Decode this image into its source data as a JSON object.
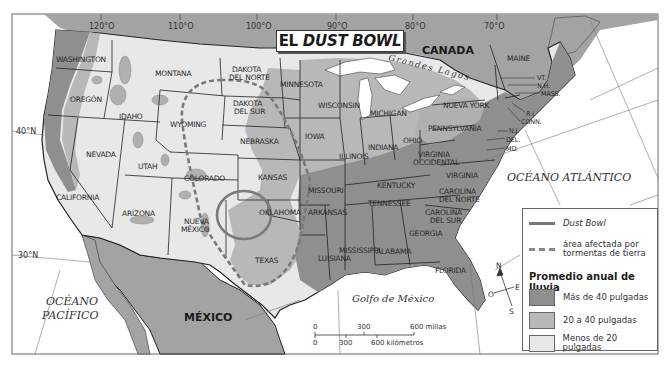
{
  "title": {
    "prefix": "EL",
    "italic": "DUST BOWL"
  },
  "graticule": {
    "longitudes": [
      "120°O",
      "110°O",
      "100°O",
      "90°O",
      "80°O",
      "70°O"
    ],
    "latitudes": [
      "40°N",
      "30°N"
    ]
  },
  "countries": [
    "CANADA",
    "MÉXICO"
  ],
  "water_labels": {
    "atlantic": "OCÉANO ATLÁNTICO",
    "pacific_line1": "OCÉANO",
    "pacific_line2": "PACÍFICO",
    "gulf": "Golfo de México",
    "great_lakes": "Grandes Lagos"
  },
  "states": {
    "washington": "WASHINGTON",
    "oregon": "OREGÓN",
    "california": "CALIFORNIA",
    "idaho": "IDAHO",
    "nevada": "NEVADA",
    "montana": "MONTANA",
    "wyoming": "WYOMING",
    "utah": "UTAH",
    "arizona": "ARIZONA",
    "colorado": "COLORADO",
    "nuevo_mexico_1": "NUEVA",
    "nuevo_mexico_2": "MÉXICO",
    "dakota_norte_1": "DAKOTA",
    "dakota_norte_2": "DEL NORTE",
    "dakota_sur_1": "DAKOTA",
    "dakota_sur_2": "DEL SUR",
    "nebraska": "NEBRASKA",
    "kansas": "KANSAS",
    "oklahoma": "OKLAHOMA",
    "texas": "TEXAS",
    "minnesota": "MINNESOTA",
    "iowa": "IOWA",
    "missouri": "MISSOURI",
    "arkansas": "ARKANSAS",
    "luisiana": "LUISIANA",
    "wisconsin": "WISCONSIN",
    "illinois": "ILLINOIS",
    "mississippi": "MISSISSIPPI",
    "michigan": "MICHIGAN",
    "indiana": "INDIANA",
    "kentucky": "KENTUCKY",
    "tennessee": "TENNESSEE",
    "alabama": "ALABAMA",
    "ohio": "OHIO",
    "georgia": "GEORGIA",
    "florida": "FLORIDA",
    "virginia_occ_1": "VIRGINIA",
    "virginia_occ_2": "OCCIDENTAL",
    "virginia": "VIRGINIA",
    "carolina_norte_1": "CAROLINA",
    "carolina_norte_2": "DEL NORTE",
    "carolina_sur_1": "CAROLINA",
    "carolina_sur_2": "DEL SUR",
    "pennsylvania": "PENNSYLVANIA",
    "nueva_york": "NUEVA YORK",
    "maine": "MAINE",
    "vt": "VT.",
    "nh": "N.H.",
    "mass": "MASS.",
    "ri": "R.I.",
    "conn": "CONN.",
    "nj": "N.J.",
    "del": "DEL.",
    "md": "MD."
  },
  "compass": {
    "n": "N",
    "s": "S",
    "e": "E",
    "o": "O"
  },
  "scale": {
    "miles_0": "0",
    "miles_300": "300",
    "miles_600": "600 millas",
    "km_0": "0",
    "km_300": "300",
    "km_600": "600 kilómetros"
  },
  "legend": {
    "dust_bowl": "Dust Bowl",
    "storm_area_1": "área afectada por",
    "storm_area_2": "tormentas de tierra",
    "rain_heading": "Promedio anual de lluvia",
    "rain_high": "Más de 40 pulgadas",
    "rain_mid": "20 a 40 pulgadas",
    "rain_low": "Menos de 20 pulgadas"
  },
  "colors": {
    "rain_high": "#8f8f8f",
    "rain_mid": "#b8b8b8",
    "rain_low": "#e8e8e8",
    "foreign_land": "#a0a0a0",
    "water": "#ffffff",
    "dust_bowl_line": "#7a7a7a"
  }
}
